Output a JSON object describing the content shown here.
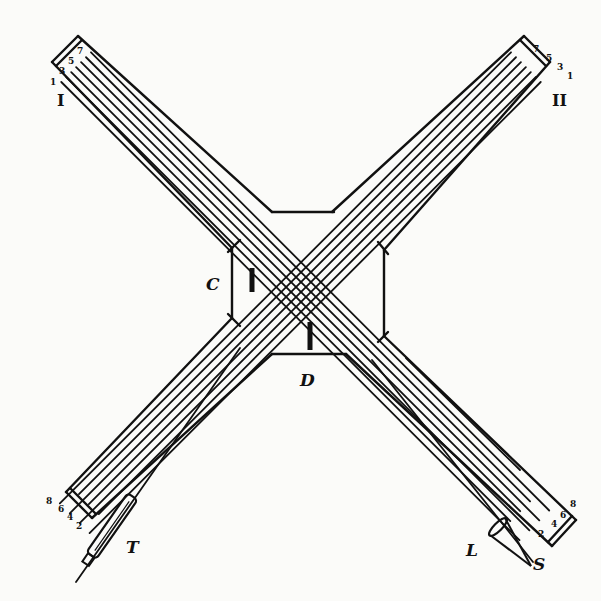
{
  "figure": {
    "ink_color": "#111111",
    "paper_color": "#fbfbf9"
  },
  "labels": {
    "tube_1": "I",
    "tube_2": "II",
    "screen_c": "C",
    "screen_d": "D",
    "telescope": "T",
    "lens": "L",
    "source": "S"
  },
  "ray_numbers": {
    "top_left": [
      "1",
      "3",
      "5",
      "7"
    ],
    "top_right": [
      "7",
      "5",
      "3",
      "1"
    ],
    "bottom_left": [
      "8",
      "6",
      "4",
      "2"
    ],
    "bottom_right": [
      "2",
      "4",
      "6",
      "8"
    ]
  }
}
